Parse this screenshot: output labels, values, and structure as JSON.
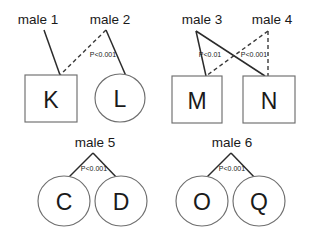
{
  "figure": {
    "background_color": "#ffffff",
    "line_color": "#2b2b2b",
    "node_stroke_color": "#6e6e6e",
    "node_fill_color": "#ffffff"
  },
  "nodes": {
    "K": {
      "label": "K",
      "shape": "square"
    },
    "L": {
      "label": "L",
      "shape": "circle"
    },
    "M": {
      "label": "M",
      "shape": "square"
    },
    "N": {
      "label": "N",
      "shape": "square"
    },
    "C": {
      "label": "C",
      "shape": "circle"
    },
    "D": {
      "label": "D",
      "shape": "circle"
    },
    "O": {
      "label": "O",
      "shape": "circle"
    },
    "Q": {
      "label": "Q",
      "shape": "circle"
    }
  },
  "males": {
    "male1": {
      "label": "male 1"
    },
    "male2": {
      "label": "male 2"
    },
    "male3": {
      "label": "male 3"
    },
    "male4": {
      "label": "male 4"
    },
    "male5": {
      "label": "male 5"
    },
    "male6": {
      "label": "male 6"
    }
  },
  "pvalues": {
    "group1": "P<0.001",
    "group2_left": "P<0.01",
    "group2_right": "P<0.001",
    "group3": "P<0.001",
    "group4": "P<0.001"
  },
  "edges": [
    {
      "id": "male1-K",
      "from": "male 1",
      "to": "K",
      "style": "solid"
    },
    {
      "id": "male2-K",
      "from": "male 2",
      "to": "K",
      "style": "dashed"
    },
    {
      "id": "male2-L",
      "from": "male 2",
      "to": "L",
      "style": "solid"
    },
    {
      "id": "male3-M",
      "from": "male 3",
      "to": "M",
      "style": "solid"
    },
    {
      "id": "male3-N",
      "from": "male 3",
      "to": "N",
      "style": "solid"
    },
    {
      "id": "male4-M",
      "from": "male 4",
      "to": "M",
      "style": "dashed"
    },
    {
      "id": "male4-N",
      "from": "male 4",
      "to": "N",
      "style": "dashed"
    },
    {
      "id": "male5-C",
      "from": "male 5",
      "to": "C",
      "style": "solid"
    },
    {
      "id": "male5-D",
      "from": "male 5",
      "to": "D",
      "style": "solid"
    },
    {
      "id": "male6-O",
      "from": "male 6",
      "to": "O",
      "style": "solid"
    },
    {
      "id": "male6-Q",
      "from": "male 6",
      "to": "Q",
      "style": "solid"
    }
  ]
}
